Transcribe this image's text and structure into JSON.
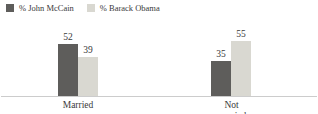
{
  "chart_data": {
    "type": "bar",
    "title": "",
    "categories": [
      "Married",
      "Not married"
    ],
    "series": [
      {
        "name": "% John McCain",
        "color": "#5e5d5b",
        "values": [
          52,
          35
        ]
      },
      {
        "name": "% Barack Obama",
        "color": "#d9d8d1",
        "values": [
          39,
          55
        ]
      }
    ],
    "xlabel": "",
    "ylabel": "",
    "ylim": [
      0,
      60
    ],
    "grid": false,
    "legend_position": "top-left",
    "value_labels": true,
    "axis_line_color": "#cccccc"
  }
}
